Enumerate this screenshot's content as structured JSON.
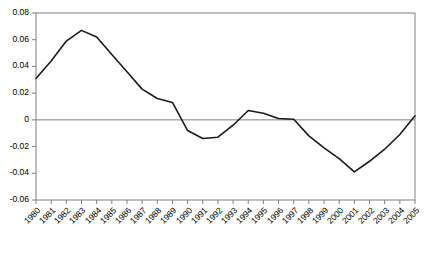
{
  "chart_data": {
    "type": "line",
    "title": "",
    "subtitle": "",
    "xlabel": "",
    "ylabel": "",
    "grid": false,
    "legend": "none",
    "xlim": [
      1980,
      2005
    ],
    "ylim": [
      -0.06,
      0.08
    ],
    "ytick_labels": [
      "0.08",
      "0.06",
      "0.04",
      "0.02",
      "0",
      "-0.02",
      "-0.04",
      "-0.06"
    ],
    "ytick_values": [
      0.08,
      0.06,
      0.04,
      0.02,
      0,
      -0.02,
      -0.04,
      -0.06
    ],
    "categories": [
      "1980",
      "1981",
      "1982",
      "1983",
      "1984",
      "1985",
      "1986",
      "1987",
      "1988",
      "1989",
      "1990",
      "1991",
      "1992",
      "1993",
      "1994",
      "1995",
      "1996",
      "1997",
      "1998",
      "1999",
      "2000",
      "2001",
      "2002",
      "2003",
      "2004",
      "2005"
    ],
    "x": [
      1980,
      1981,
      1982,
      1983,
      1984,
      1985,
      1986,
      1987,
      1988,
      1989,
      1990,
      1991,
      1992,
      1993,
      1994,
      1995,
      1996,
      1997,
      1998,
      1999,
      2000,
      2001,
      2002,
      2003,
      2004,
      2005
    ],
    "values": [
      0.031,
      0.044,
      0.059,
      0.067,
      0.062,
      0.049,
      0.036,
      0.023,
      0.016,
      0.013,
      -0.008,
      -0.014,
      -0.013,
      -0.004,
      0.007,
      0.005,
      0.001,
      0.0005,
      -0.012,
      -0.021,
      -0.029,
      -0.039,
      -0.031,
      -0.022,
      -0.011,
      0.003
    ],
    "series": [
      {
        "name": "series-1",
        "color": "#1a1a1a",
        "values": [
          0.031,
          0.044,
          0.059,
          0.067,
          0.062,
          0.049,
          0.036,
          0.023,
          0.016,
          0.013,
          -0.008,
          -0.014,
          -0.013,
          -0.004,
          0.007,
          0.005,
          0.001,
          0.0005,
          -0.012,
          -0.021,
          -0.029,
          -0.039,
          -0.031,
          -0.022,
          -0.011,
          0.003
        ]
      }
    ],
    "zero_line": 0,
    "colors": {
      "line": "#1a1a1a",
      "axis": "#808080",
      "frame": "#808080",
      "zero_line": "#808080",
      "text": "#000000",
      "background": "#ffffff"
    }
  }
}
